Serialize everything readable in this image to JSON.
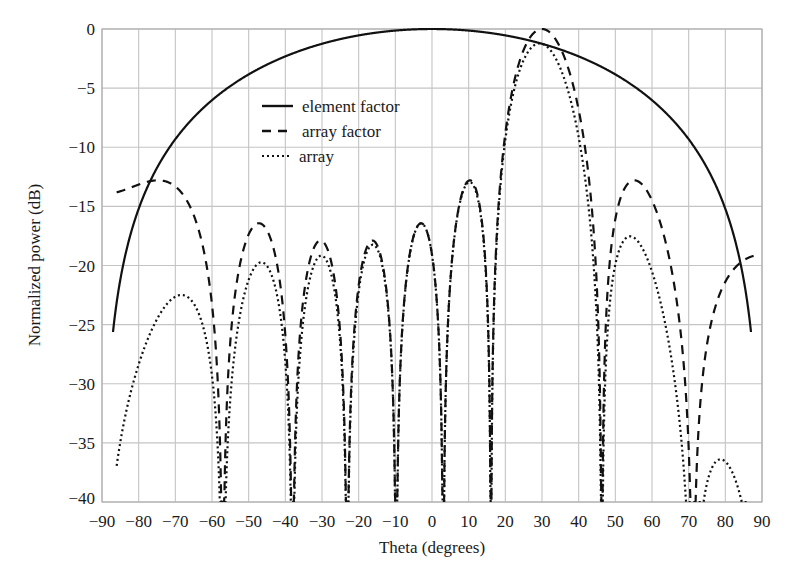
{
  "chart_data": {
    "type": "line",
    "title": "",
    "xlabel": "Theta (degrees)",
    "ylabel": "Normalized power (dB)",
    "xlim": [
      -90,
      90
    ],
    "ylim": [
      -40,
      0
    ],
    "xticks": [
      -90,
      -80,
      -70,
      -60,
      -50,
      -40,
      -30,
      -20,
      -10,
      0,
      10,
      20,
      30,
      40,
      50,
      60,
      70,
      80,
      90
    ],
    "yticks": [
      0,
      -5,
      -10,
      -15,
      -20,
      -25,
      -30,
      -35,
      -40
    ],
    "xtick_labels": [
      "−90",
      "−80",
      "−70",
      "−60",
      "−50",
      "−40",
      "−30",
      "−20",
      "−10",
      "0",
      "10",
      "20",
      "30",
      "40",
      "50",
      "60",
      "70",
      "80",
      "90"
    ],
    "ytick_labels": [
      "0",
      "−5",
      "−10",
      "−15",
      "−20",
      "−25",
      "−30",
      "−35",
      "−40"
    ],
    "grid": true,
    "legend_position": "upper-left-center",
    "series": [
      {
        "name": "element factor",
        "style": "solid",
        "x": [
          -87,
          -86,
          -84,
          -82,
          -80,
          -75,
          -70,
          -65,
          -60,
          -50,
          -40,
          -30,
          -20,
          -10,
          0,
          10,
          20,
          30,
          40,
          50,
          60,
          65,
          70,
          75,
          80,
          82,
          84,
          86,
          87
        ],
        "values": [
          -35,
          -30,
          -24.5,
          -21,
          -18.5,
          -14.5,
          -11.5,
          -9.2,
          -7.4,
          -4.9,
          -3.1,
          -1.8,
          -0.9,
          -0.3,
          0,
          -0.3,
          -0.9,
          -1.8,
          -3.1,
          -4.9,
          -7.4,
          -9.2,
          -11.5,
          -14.5,
          -18.5,
          -21,
          -24.5,
          -30,
          -35
        ]
      },
      {
        "name": "array factor",
        "style": "dashed",
        "peaks": [
          {
            "theta": -62,
            "value": -16.5
          },
          {
            "theta": -40,
            "value": -18
          },
          {
            "theta": -22,
            "value": -18.3
          },
          {
            "theta": -7,
            "value": -16.5
          },
          {
            "theta": 10,
            "value": -13
          },
          {
            "theta": 30,
            "value": 0
          },
          {
            "theta": 59,
            "value": -13
          }
        ],
        "nulls": [
          -48.5,
          -31.5,
          -14.5,
          0.3,
          14.5,
          48.5,
          82
        ],
        "x_range": [
          -82,
          85
        ]
      },
      {
        "name": "array",
        "style": "dotted",
        "peaks": [
          {
            "theta": -60,
            "value": -23
          },
          {
            "theta": -40,
            "value": -20
          },
          {
            "theta": -22,
            "value": -19
          },
          {
            "theta": -7,
            "value": -16.7
          },
          {
            "theta": 10,
            "value": -13.2
          },
          {
            "theta": 29,
            "value": -1.2
          },
          {
            "theta": 59,
            "value": -18.5
          }
        ],
        "nulls": [
          -48.5,
          -31.5,
          -14.5,
          0.3,
          14.5,
          48.5
        ],
        "x_range": [
          -78,
          79
        ]
      }
    ],
    "legend": [
      "element factor",
      "array factor",
      "array"
    ]
  }
}
